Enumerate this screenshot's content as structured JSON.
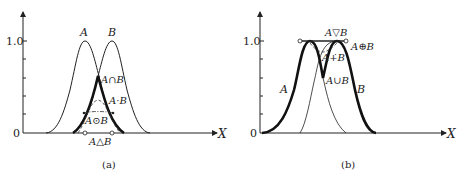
{
  "figure": {
    "panels": [
      {
        "id": "a",
        "caption": "(a)",
        "y_ticks": {
          "top": "1.0",
          "zero": "0"
        },
        "x_axis_label": "X",
        "curves": [
          {
            "name": "A",
            "label": "A"
          },
          {
            "name": "B",
            "label": "B"
          }
        ],
        "annotations": {
          "intersection": "A∩B",
          "product": "A·B",
          "bounded_product": "A⊙B",
          "drastic_product": "A△B"
        }
      },
      {
        "id": "b",
        "caption": "(b)",
        "y_ticks": {
          "top": "1.0",
          "zero": "0"
        },
        "x_axis_label": "X",
        "curves": [
          {
            "name": "A",
            "label": "A"
          },
          {
            "name": "B",
            "label": "B"
          }
        ],
        "annotations": {
          "drastic_sum": "A▽B",
          "bounded_sum": "A⊕B",
          "algebraic_sum": "A+̇B",
          "union": "A∪B"
        }
      }
    ]
  }
}
